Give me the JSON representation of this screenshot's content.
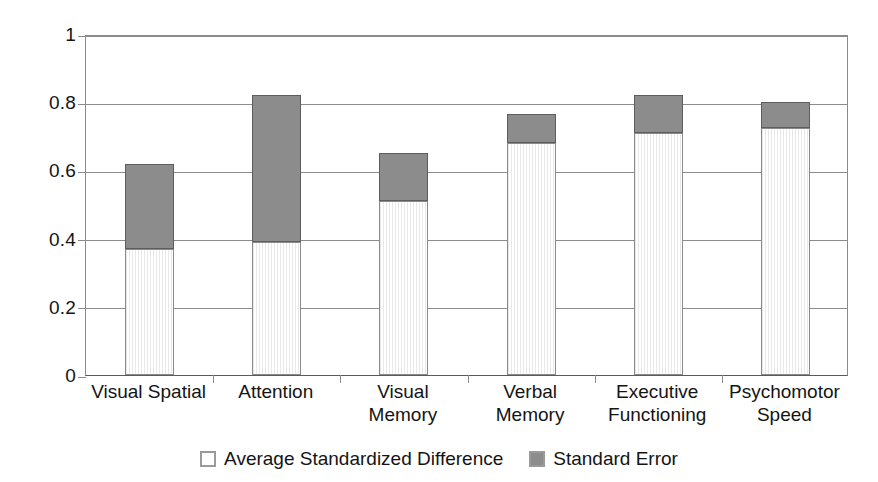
{
  "chart_data": {
    "type": "bar",
    "subtype": "stacked-bar",
    "title": "",
    "xlabel": "",
    "ylabel": "",
    "ylim": [
      0,
      1
    ],
    "yticks": [
      "0",
      "0.2",
      "0.4",
      "0.6",
      "0.8",
      "1"
    ],
    "ytick_values": [
      0,
      0.2,
      0.4,
      0.6,
      0.8,
      1
    ],
    "grid": true,
    "legend_position": "bottom",
    "categories": [
      "Visual Spatial",
      "Attention",
      "Visual Memory",
      "Verbal Memory",
      "Executive Functioning",
      "Psychomotor Speed"
    ],
    "category_lines": [
      [
        "Visual Spatial"
      ],
      [
        "Attention"
      ],
      [
        "Visual",
        "Memory"
      ],
      [
        "Verbal",
        "Memory"
      ],
      [
        "Executive",
        "Functioning"
      ],
      [
        "Psychomotor",
        "Speed"
      ]
    ],
    "series": [
      {
        "name": "Average Standardized Difference",
        "color": "#fdfdfd",
        "values": [
          0.37,
          0.39,
          0.51,
          0.68,
          0.71,
          0.725
        ]
      },
      {
        "name": "Standard Error",
        "color": "#8c8c8c",
        "values": [
          0.25,
          0.43,
          0.14,
          0.085,
          0.11,
          0.075
        ]
      }
    ],
    "totals": [
      0.62,
      0.82,
      0.65,
      0.765,
      0.82,
      0.8
    ]
  },
  "legend": {
    "items": [
      {
        "label": "Average Standardized Difference",
        "swatch": "white-outline-swatch"
      },
      {
        "label": "Standard Error",
        "swatch": "gray-swatch"
      }
    ]
  },
  "colors": {
    "standard_error": "#8c8c8c",
    "average_difference": "#fdfdfd",
    "axis": "#8b8b8b",
    "text": "#141414"
  }
}
